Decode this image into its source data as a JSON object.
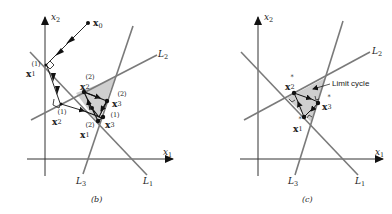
{
  "colors": {
    "line": "#7a7a7a",
    "axis": "#333333",
    "shade": "#cfcfcf",
    "point": "#111111",
    "text": "#222222"
  },
  "panels": [
    {
      "id": "b",
      "caption": "(b)",
      "axes": {
        "x_label": "x",
        "x_sub": "1",
        "y_label": "x",
        "y_sub": "2"
      },
      "lines": [
        {
          "name": "L",
          "sub": "1"
        },
        {
          "name": "L",
          "sub": "2"
        },
        {
          "name": "L",
          "sub": "3"
        }
      ],
      "points": [
        {
          "label": "x",
          "sub": "0",
          "sup": ""
        },
        {
          "label": "x",
          "sub": "1",
          "sup": "(1)"
        },
        {
          "label": "x",
          "sub": "2",
          "sup": "(1)"
        },
        {
          "label": "x",
          "sub": "3",
          "sup": "(1)"
        },
        {
          "label": "x",
          "sub": "1",
          "sup": "(2)"
        },
        {
          "label": "x",
          "sub": "2",
          "sup": "(2)"
        },
        {
          "label": "x",
          "sub": "3",
          "sup": "(2)"
        }
      ]
    },
    {
      "id": "c",
      "caption": "(c)",
      "axes": {
        "x_label": "x",
        "x_sub": "1",
        "y_label": "x",
        "y_sub": "2"
      },
      "lines": [
        {
          "name": "L",
          "sub": "1"
        },
        {
          "name": "L",
          "sub": "2"
        },
        {
          "name": "L",
          "sub": "3"
        }
      ],
      "points": [
        {
          "label": "x",
          "sub": "1",
          "sup": "*"
        },
        {
          "label": "x",
          "sub": "2",
          "sup": "*"
        },
        {
          "label": "x",
          "sub": "3",
          "sup": "*"
        }
      ],
      "annotation": "Limit cycle"
    }
  ]
}
